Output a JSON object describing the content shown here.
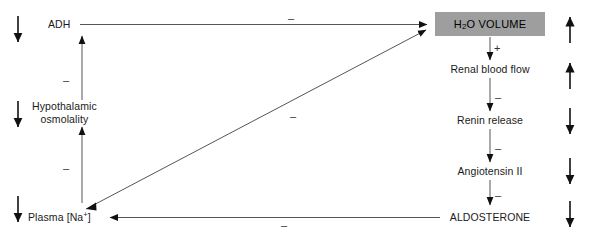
{
  "diagram": {
    "canvas": {
      "width": 589,
      "height": 241
    },
    "colors": {
      "box_fill": "#9e9e9e",
      "line": "#4a4a4a",
      "text": "#1a1a1a",
      "arrow": "#111111"
    },
    "nodes": {
      "adh": {
        "label": "ADH",
        "x": 48,
        "y": 20
      },
      "hypothalamic_osmolality": {
        "line1": "Hypothalamic",
        "line2": "osmolality",
        "x": 32,
        "y": 103
      },
      "plasma_na": {
        "label_pre": "Plasma [Na",
        "label_sup": "+",
        "label_post": "]",
        "x": 28,
        "y": 211
      },
      "h2o_volume": {
        "label_pre": "H",
        "label_sub": "2",
        "label_post": "O VOLUME",
        "x": 435,
        "y": 12,
        "width": 110,
        "height": 24
      },
      "renal_blood_flow": {
        "label": "Renal blood flow",
        "x": 490,
        "y": 68
      },
      "renin_release": {
        "label": "Renin release",
        "x": 490,
        "y": 119
      },
      "angiotensin_ii": {
        "label": "Angiotensin II",
        "x": 490,
        "y": 170
      },
      "aldosterone": {
        "label": "ALDOSTERONE",
        "x": 490,
        "y": 213
      }
    },
    "signs": [
      {
        "id": "sign-adh-to-h2o",
        "symbol": "–",
        "x": 288,
        "y": 13
      },
      {
        "id": "sign-osmolality-to-adh",
        "symbol": "–",
        "x": 63,
        "y": 75
      },
      {
        "id": "sign-plasma-to-osmolality",
        "symbol": "–",
        "x": 63,
        "y": 163
      },
      {
        "id": "sign-plasma-to-h2o",
        "symbol": "–",
        "x": 290,
        "y": 111
      },
      {
        "id": "sign-h2o-to-renal",
        "symbol": "+",
        "x": 494,
        "y": 43
      },
      {
        "id": "sign-renal-to-renin",
        "symbol": "–",
        "x": 495,
        "y": 92
      },
      {
        "id": "sign-renin-to-angiotensin",
        "symbol": "–",
        "x": 495,
        "y": 143
      },
      {
        "id": "sign-angiotensin-to-aldosterone",
        "symbol": "–",
        "x": 495,
        "y": 190
      },
      {
        "id": "sign-aldosterone-to-plasma",
        "symbol": "–",
        "x": 281,
        "y": 220
      }
    ],
    "left_indicators": [
      {
        "id": "indicator-adh-decrease",
        "direction": "down",
        "x": 18,
        "y_top": 16,
        "y_bottom": 48
      },
      {
        "id": "indicator-osmolality-decrease",
        "direction": "down",
        "x": 18,
        "y_top": 101,
        "y_bottom": 133
      },
      {
        "id": "indicator-plasma-na-decrease",
        "direction": "down",
        "x": 18,
        "y_top": 196,
        "y_bottom": 228
      }
    ],
    "right_indicators": [
      {
        "id": "indicator-h2o-volume-increase",
        "direction": "up",
        "x": 570,
        "y_top": 11,
        "y_bottom": 43
      },
      {
        "id": "indicator-renal-blood-flow-increase",
        "direction": "up",
        "x": 570,
        "y_top": 57,
        "y_bottom": 89
      },
      {
        "id": "indicator-renin-release-decrease",
        "direction": "down",
        "x": 570,
        "y_top": 108,
        "y_bottom": 140
      },
      {
        "id": "indicator-angiotensin-ii-decrease",
        "direction": "down",
        "x": 570,
        "y_top": 158,
        "y_bottom": 190
      },
      {
        "id": "indicator-aldosterone-decrease",
        "direction": "down",
        "x": 570,
        "y_top": 201,
        "y_bottom": 233
      }
    ],
    "connections": [
      {
        "id": "edge-adh-to-h2o-volume",
        "from": "adh",
        "to": "h2o_volume",
        "type": "horizontal-right"
      },
      {
        "id": "edge-osmolality-to-adh",
        "from": "hypothalamic_osmolality",
        "to": "adh",
        "type": "vertical-up"
      },
      {
        "id": "edge-plasma-na-to-osmolality",
        "from": "plasma_na",
        "to": "hypothalamic_osmolality",
        "type": "vertical-up"
      },
      {
        "id": "edge-plasma-na-to-h2o-volume",
        "from": "plasma_na",
        "to": "h2o_volume",
        "type": "diagonal-up-right"
      },
      {
        "id": "edge-h2o-volume-to-renal",
        "from": "h2o_volume",
        "to": "renal_blood_flow",
        "type": "vertical-down"
      },
      {
        "id": "edge-renal-to-renin",
        "from": "renal_blood_flow",
        "to": "renin_release",
        "type": "vertical-down"
      },
      {
        "id": "edge-renin-to-angiotensin",
        "from": "renin_release",
        "to": "angiotensin_ii",
        "type": "vertical-down"
      },
      {
        "id": "edge-angiotensin-to-aldosterone",
        "from": "angiotensin_ii",
        "to": "aldosterone",
        "type": "vertical-down"
      },
      {
        "id": "edge-aldosterone-to-plasma-na",
        "from": "aldosterone",
        "to": "plasma_na",
        "type": "horizontal-left"
      }
    ]
  }
}
